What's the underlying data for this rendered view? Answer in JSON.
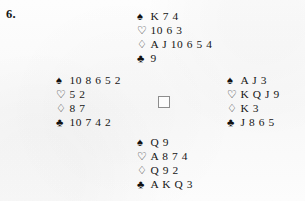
{
  "problem": {
    "number": "6."
  },
  "suits": {
    "spade": "♠",
    "heart": "♡",
    "diamond": "♢",
    "club": "♣"
  },
  "suit_names": {
    "spade": "spade-suit-icon",
    "heart": "heart-suit-icon",
    "diamond": "diamond-suit-icon",
    "club": "club-suit-icon"
  },
  "hands": {
    "north": {
      "position": "North",
      "spades": "K 7 4",
      "hearts": "10 6 3",
      "diamonds": "A J 10 6 5 4",
      "clubs": "9"
    },
    "west": {
      "position": "West",
      "spades": "10 8 6 5 2",
      "hearts": "5 2",
      "diamonds": "8 7",
      "clubs": "10 7 4 2"
    },
    "east": {
      "position": "East",
      "spades": "A J 3",
      "hearts": "K Q J 9",
      "diamonds": "K 3",
      "clubs": "J 8 6 5"
    },
    "south": {
      "position": "South",
      "spades": "Q 9",
      "hearts": "A 8 7 4",
      "diamonds": "Q 9 2",
      "clubs": "A K Q 3"
    }
  },
  "center": {
    "marker": "compass-box"
  },
  "colors": {
    "ink": "#161616",
    "page": "#fbfbfb",
    "box_border": "#8d8d8d"
  }
}
